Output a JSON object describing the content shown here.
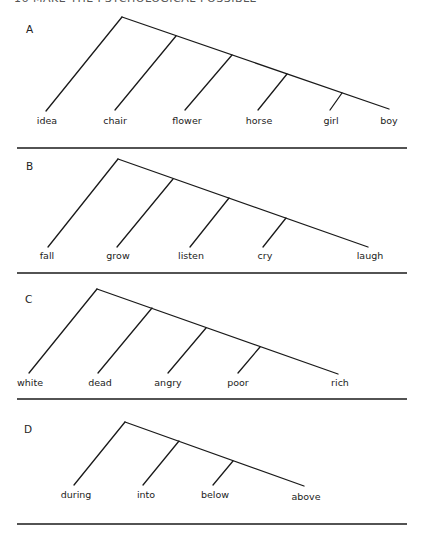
{
  "header": {
    "text": "16     MAKE THE PSYCHOLOGICAL POSSIBLE"
  },
  "diagrams": [
    {
      "id": "A",
      "label": "A",
      "label_pos": [
        26,
        33
      ],
      "apex": [
        122,
        17
      ],
      "end": [
        389,
        109
      ],
      "first_leaf": [
        46,
        111
      ],
      "branches": [
        {
          "junction": [
            176,
            36
          ],
          "leaf": [
            115,
            110
          ]
        },
        {
          "junction": [
            232,
            55
          ],
          "leaf": [
            185,
            110
          ]
        },
        {
          "junction": [
            287,
            74
          ],
          "leaf": [
            258,
            110
          ]
        },
        {
          "junction": [
            342,
            93
          ],
          "leaf": [
            330,
            110
          ]
        }
      ],
      "words": [
        {
          "text": "idea",
          "x": 47,
          "y": 124
        },
        {
          "text": "chair",
          "x": 115,
          "y": 124
        },
        {
          "text": "flower",
          "x": 187,
          "y": 124
        },
        {
          "text": "horse",
          "x": 259,
          "y": 124
        },
        {
          "text": "girl",
          "x": 331,
          "y": 124
        },
        {
          "text": "boy",
          "x": 389,
          "y": 124
        }
      ],
      "rule_y": 148
    },
    {
      "id": "B",
      "label": "B",
      "label_pos": [
        26,
        170
      ],
      "apex": [
        118,
        159
      ],
      "end": [
        368,
        247
      ],
      "first_leaf": [
        48,
        247
      ],
      "branches": [
        {
          "junction": [
            173,
            179
          ],
          "leaf": [
            117,
            247
          ]
        },
        {
          "junction": [
            229,
            198
          ],
          "leaf": [
            190,
            247
          ]
        },
        {
          "junction": [
            286,
            218
          ],
          "leaf": [
            263,
            247
          ]
        }
      ],
      "words": [
        {
          "text": "fall",
          "x": 47,
          "y": 259
        },
        {
          "text": "grow",
          "x": 118,
          "y": 259
        },
        {
          "text": "listen",
          "x": 191,
          "y": 259
        },
        {
          "text": "cry",
          "x": 265,
          "y": 259
        },
        {
          "text": "laugh",
          "x": 370,
          "y": 259
        }
      ],
      "rule_y": 273
    },
    {
      "id": "C",
      "label": "C",
      "label_pos": [
        25,
        303
      ],
      "apex": [
        97,
        289
      ],
      "end": [
        338,
        374
      ],
      "first_leaf": [
        29,
        373
      ],
      "branches": [
        {
          "junction": [
            152,
            308
          ],
          "leaf": [
            98,
            373
          ]
        },
        {
          "junction": [
            206,
            328
          ],
          "leaf": [
            168,
            373
          ]
        },
        {
          "junction": [
            260,
            347
          ],
          "leaf": [
            238,
            373
          ]
        }
      ],
      "words": [
        {
          "text": "white",
          "x": 30,
          "y": 386
        },
        {
          "text": "dead",
          "x": 100,
          "y": 386
        },
        {
          "text": "angry",
          "x": 168,
          "y": 386
        },
        {
          "text": "poor",
          "x": 238,
          "y": 386
        },
        {
          "text": "rich",
          "x": 340,
          "y": 386
        }
      ],
      "rule_y": 399
    },
    {
      "id": "D",
      "label": "D",
      "label_pos": [
        24,
        433
      ],
      "apex": [
        125,
        422
      ],
      "end": [
        304,
        486
      ],
      "first_leaf": [
        74,
        485
      ],
      "branches": [
        {
          "junction": [
            179,
            441
          ],
          "leaf": [
            143,
            485
          ]
        },
        {
          "junction": [
            233,
            461
          ],
          "leaf": [
            213,
            485
          ]
        }
      ],
      "words": [
        {
          "text": "during",
          "x": 76,
          "y": 498
        },
        {
          "text": "into",
          "x": 146,
          "y": 498
        },
        {
          "text": "below",
          "x": 215,
          "y": 498
        },
        {
          "text": "above",
          "x": 306,
          "y": 500
        }
      ],
      "rule_y": 524
    }
  ],
  "rule_x": [
    17,
    407
  ],
  "colors": {
    "ink": "#1a1a1a",
    "paper": "#ffffff"
  }
}
